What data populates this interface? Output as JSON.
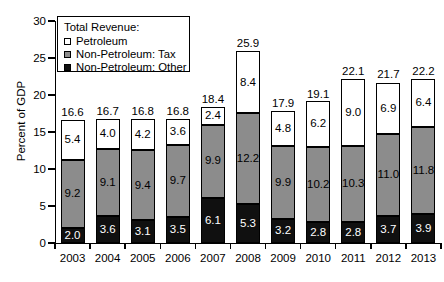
{
  "chart_data": {
    "type": "bar",
    "subtype": "stacked-bar",
    "title": "",
    "xlabel": "",
    "ylabel": "Percent of GDP",
    "ylim": [
      0,
      30
    ],
    "yticks": [
      0,
      5,
      10,
      15,
      20,
      25,
      30
    ],
    "ytick_labels": [
      "0",
      "5",
      "10",
      "15",
      "20",
      "25",
      "30"
    ],
    "grid": false,
    "legend_position": "top-left",
    "legend_title": "Total Revenue:",
    "categories": [
      "2003",
      "2004",
      "2005",
      "2006",
      "2007",
      "2008",
      "2009",
      "2010",
      "2011",
      "2012",
      "2013"
    ],
    "series": [
      {
        "name": "Non-Petroleum: Other",
        "color": "#101010",
        "values": [
          2.0,
          3.6,
          3.1,
          3.5,
          6.1,
          5.3,
          3.2,
          2.8,
          2.8,
          3.7,
          3.9
        ]
      },
      {
        "name": "Non-Petroleum: Tax",
        "color": "#8c8c8c",
        "values": [
          9.2,
          9.1,
          9.4,
          9.7,
          9.9,
          12.2,
          9.9,
          10.2,
          10.3,
          11.0,
          11.8
        ]
      },
      {
        "name": "Petroleum",
        "color": "#ffffff",
        "values": [
          5.4,
          4.0,
          4.2,
          3.6,
          2.4,
          8.4,
          4.8,
          6.2,
          9.0,
          6.9,
          6.4
        ]
      }
    ],
    "totals": [
      16.6,
      16.7,
      16.8,
      16.8,
      18.4,
      25.9,
      17.9,
      19.1,
      22.1,
      21.7,
      22.2
    ],
    "total_labels": [
      "16.6",
      "16.7",
      "16.8",
      "16.8",
      "18.4",
      "25.9",
      "17.9",
      "19.1",
      "22.1",
      "21.7",
      "22.2"
    ],
    "segment_labels": {
      "petroleum": [
        "5.4",
        "4.0",
        "4.2",
        "3.6",
        "2.4",
        "8.4",
        "4.8",
        "6.2",
        "9.0",
        "6.9",
        "6.4"
      ],
      "tax": [
        "9.2",
        "9.1",
        "9.4",
        "9.7",
        "9.9",
        "12.2",
        "9.9",
        "10.2",
        "10.3",
        "11.0",
        "11.8"
      ],
      "other": [
        "2.0",
        "3.6",
        "3.1",
        "3.5",
        "6.1",
        "5.3",
        "3.2",
        "2.8",
        "2.8",
        "3.7",
        "3.9"
      ]
    }
  },
  "legend": {
    "title": "Total Revenue:",
    "items": [
      {
        "label": "Petroleum",
        "swatch": "petroleum"
      },
      {
        "label": "Non-Petroleum: Tax",
        "swatch": "tax"
      },
      {
        "label": "Non-Petroleum: Other",
        "swatch": "other"
      }
    ]
  },
  "axes": {
    "y_title": "Percent of GDP"
  }
}
